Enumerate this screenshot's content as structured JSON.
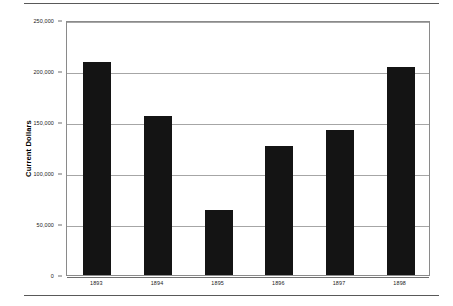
{
  "chart_data": {
    "type": "bar",
    "title": "",
    "subtitle": "",
    "xlabel": "",
    "ylabel": "Current Dollars",
    "categories": [
      "1893",
      "1894",
      "1895",
      "1896",
      "1897",
      "1898"
    ],
    "values": [
      209000,
      156000,
      63500,
      126000,
      142500,
      203500
    ],
    "series": [
      {
        "name": "Current Dollars",
        "values": [
          209000,
          156000,
          63500,
          126000,
          142500,
          203500
        ]
      }
    ],
    "ylim": [
      0,
      250000
    ],
    "y_ticks": [
      0,
      50000,
      100000,
      150000,
      200000,
      250000
    ],
    "y_tick_labels": [
      "0",
      "50,000",
      "100,000",
      "150,000",
      "200,000",
      "250,000"
    ],
    "grid": true,
    "grid_axis": "y",
    "legend": false,
    "legend_position": "none",
    "bar_color": "#141414",
    "grid_color": "#a6a6a6",
    "frame_color": "#8a8a8a",
    "background_color": "#ffffff"
  },
  "figure": {
    "rule_color": "#595959",
    "top_rule": true,
    "bottom_rule": true
  }
}
